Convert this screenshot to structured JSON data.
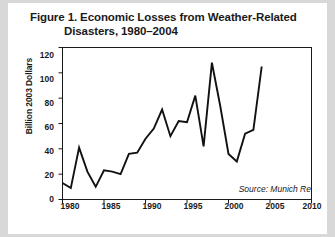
{
  "figure": {
    "title_line1": "Figure 1. Economic Losses from Weather-Related",
    "title_line2": "Disasters, 1980–2004",
    "source": "Source: Munich Re"
  },
  "chart_data": {
    "type": "line",
    "title": "Figure 1. Economic Losses from Weather-Related Disasters, 1980–2004",
    "xlabel": "",
    "ylabel": "Billion 2003 Dollars",
    "xlim": [
      1980,
      2010
    ],
    "ylim": [
      0,
      120
    ],
    "xticks": [
      1980,
      1985,
      1990,
      1995,
      2000,
      2005,
      2010
    ],
    "yticks": [
      0,
      20,
      40,
      60,
      80,
      100,
      120
    ],
    "grid": false,
    "legend": null,
    "line_color": "#111111",
    "x": [
      1980,
      1981,
      1982,
      1983,
      1984,
      1985,
      1986,
      1987,
      1988,
      1989,
      1990,
      1991,
      1992,
      1993,
      1994,
      1995,
      1996,
      1997,
      1998,
      1999,
      2000,
      2001,
      2002,
      2003,
      2004
    ],
    "values": [
      13,
      9,
      41,
      22,
      10,
      23,
      22,
      20,
      36,
      37,
      48,
      56,
      71,
      50,
      62,
      61,
      82,
      42,
      108,
      74,
      36,
      30,
      52,
      55,
      105
    ],
    "annotations": [
      {
        "text": "Source: Munich Re",
        "position": "bottom-right",
        "style": "italic"
      }
    ]
  }
}
